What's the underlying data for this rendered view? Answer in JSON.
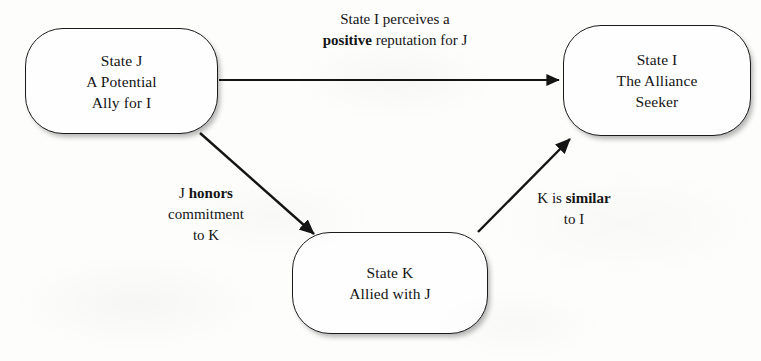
{
  "diagram": {
    "background_color": "#fdfdfc",
    "stroke_color": "#1b1b1b",
    "text_color": "#141414",
    "nodes": [
      {
        "id": "state-j",
        "label": "State J\nA Potential\nAlly for I",
        "lines": [
          "State J",
          "A Potential",
          "Ally for I"
        ],
        "x": 25,
        "y": 28,
        "width": 193,
        "height": 106
      },
      {
        "id": "state-i",
        "label": "State I\nThe Alliance\nSeeker",
        "lines": [
          "State I",
          "The Alliance",
          "Seeker"
        ],
        "x": 563,
        "y": 25,
        "width": 188,
        "height": 111
      },
      {
        "id": "state-k",
        "label": "State K\nAllied with J",
        "lines": [
          "State K",
          "Allied with J"
        ],
        "x": 292,
        "y": 232,
        "width": 196,
        "height": 102
      }
    ],
    "edges": [
      {
        "id": "edge-j-to-i",
        "from": "state-j",
        "to": "state-i",
        "label_lines": [
          [
            {
              "text": "State I perceives a",
              "bold": false
            }
          ],
          [
            {
              "text": "positive",
              "bold": true
            },
            {
              "text": " reputation for J",
              "bold": false
            }
          ]
        ],
        "label_plain": "State I perceives a positive reputation for J"
      },
      {
        "id": "edge-j-to-k",
        "from": "state-j",
        "to": "state-k",
        "label_lines": [
          [
            {
              "text": "J ",
              "bold": false
            },
            {
              "text": "honors",
              "bold": true
            }
          ],
          [
            {
              "text": "commitment",
              "bold": false
            }
          ],
          [
            {
              "text": "to K",
              "bold": false
            }
          ]
        ],
        "label_plain": "J honors commitment to K"
      },
      {
        "id": "edge-k-to-i",
        "from": "state-k",
        "to": "state-i",
        "label_lines": [
          [
            {
              "text": "K is ",
              "bold": false
            },
            {
              "text": "similar",
              "bold": true
            }
          ],
          [
            {
              "text": "to I",
              "bold": false
            }
          ]
        ],
        "label_plain": "K is similar to I"
      }
    ]
  }
}
